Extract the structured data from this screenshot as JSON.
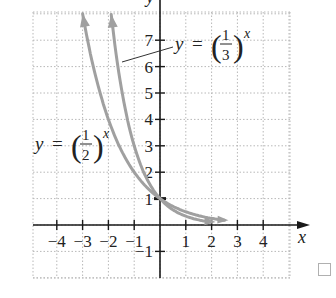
{
  "chart_data": {
    "type": "line",
    "title": "",
    "xlabel": "x",
    "ylabel": "y",
    "xlim": [
      -5,
      5
    ],
    "ylim": [
      -2,
      8
    ],
    "grid": true,
    "x_ticks": [
      -4,
      -3,
      -2,
      -1,
      1,
      2,
      3,
      4
    ],
    "y_ticks": [
      -1,
      1,
      2,
      3,
      4,
      5,
      6,
      7
    ],
    "x_tick_labels": [
      "−4",
      "−3",
      "−2",
      "−1",
      "1",
      "2",
      "3",
      "4"
    ],
    "y_tick_labels": [
      "−1",
      "1",
      "2",
      "3",
      "4",
      "5",
      "6",
      "7"
    ],
    "series": [
      {
        "name": "y = (1/2)^x",
        "base": 0.5,
        "x": [
          -3,
          -2,
          -1,
          0,
          1,
          2,
          2.5
        ],
        "y": [
          8,
          4,
          2,
          1,
          0.5,
          0.25,
          0.18
        ],
        "color": "#a0a0a0"
      },
      {
        "name": "y = (1/3)^x",
        "base": 0.3333,
        "x": [
          -1.89,
          -1,
          0,
          1,
          2
        ],
        "y": [
          8,
          3,
          1,
          0.333,
          0.111
        ],
        "color": "#a0a0a0"
      }
    ],
    "annotations": [
      {
        "text": "y = (1/2)^x",
        "position": "left-middle"
      },
      {
        "text": "y = (1/3)^x",
        "position": "upper-right",
        "leader_line": true
      }
    ],
    "y_intercept_marker": {
      "x": 0,
      "y": 1
    }
  },
  "labels": {
    "x_axis": "x",
    "y_axis": "y",
    "eq_half": {
      "lhs": "y",
      "eq": "=",
      "num": "1",
      "den": "2",
      "exp": "x"
    },
    "eq_third": {
      "lhs": "y",
      "eq": "=",
      "num": "1",
      "den": "3",
      "exp": "x"
    }
  },
  "colors": {
    "axis": "#1a1a1a",
    "grid": "#b8b8b8",
    "curve": "#a0a0a0",
    "text": "#222222"
  }
}
